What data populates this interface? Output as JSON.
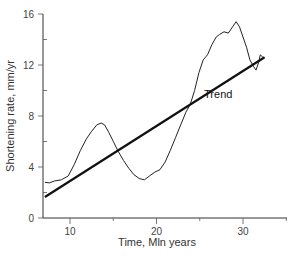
{
  "chart_data": {
    "type": "line",
    "title": "",
    "xlabel": "Time, Mln years",
    "ylabel": "Shortening rate, mm/yr",
    "xlim": [
      6.5,
      35
    ],
    "ylim": [
      0,
      16
    ],
    "xticks": [
      10,
      20,
      30
    ],
    "yticks": [
      0,
      4,
      8,
      12,
      16
    ],
    "grid": false,
    "legend": null,
    "annotations": [
      {
        "text": "Trend",
        "x": 25.5,
        "y": 9.4
      }
    ],
    "series": [
      {
        "name": "Shortening rate",
        "color": "#222222",
        "x": [
          7.1,
          7.6,
          8.2,
          9.0,
          9.8,
          10.5,
          11.2,
          11.9,
          12.5,
          13.1,
          13.6,
          14.0,
          14.5,
          15.0,
          15.6,
          16.2,
          16.8,
          17.4,
          18.0,
          18.6,
          19.2,
          19.8,
          20.4,
          21.0,
          21.6,
          22.2,
          22.8,
          23.4,
          23.9,
          24.4,
          24.9,
          25.4,
          25.9,
          26.4,
          26.9,
          27.3,
          27.8,
          28.3,
          28.8,
          29.2,
          29.6,
          30.0,
          30.4,
          30.8,
          31.2,
          31.5,
          31.8,
          32.0,
          32.3
        ],
        "values": [
          2.8,
          2.75,
          2.9,
          3.0,
          3.3,
          4.2,
          5.3,
          6.2,
          6.8,
          7.3,
          7.45,
          7.3,
          6.7,
          6.0,
          5.2,
          4.5,
          3.9,
          3.4,
          3.1,
          3.0,
          3.3,
          3.6,
          3.8,
          4.4,
          5.3,
          6.3,
          7.3,
          8.3,
          8.9,
          10.0,
          11.4,
          12.4,
          12.8,
          13.6,
          14.2,
          14.4,
          14.6,
          14.5,
          15.0,
          15.4,
          15.0,
          14.2,
          13.4,
          12.4,
          11.9,
          11.6,
          12.2,
          12.8,
          12.6
        ]
      },
      {
        "name": "Trend",
        "color": "#111111",
        "x": [
          7.1,
          32.5
        ],
        "values": [
          1.65,
          12.6
        ]
      }
    ]
  }
}
